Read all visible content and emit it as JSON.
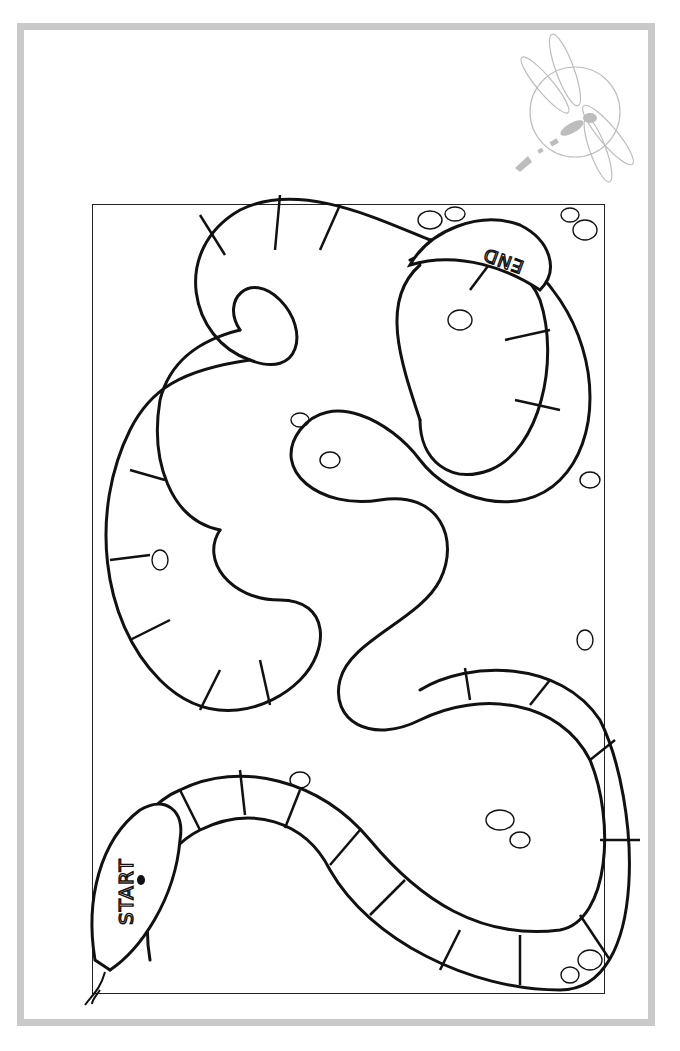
{
  "page": {
    "type": "snake board game coloring page",
    "frame_color": "#c9c9c9",
    "line_color": "#111111"
  },
  "board": {
    "start_label": "START",
    "end_label": "END"
  },
  "logo": {
    "icon": "dragonfly-icon",
    "color": "#bdbdbd"
  }
}
